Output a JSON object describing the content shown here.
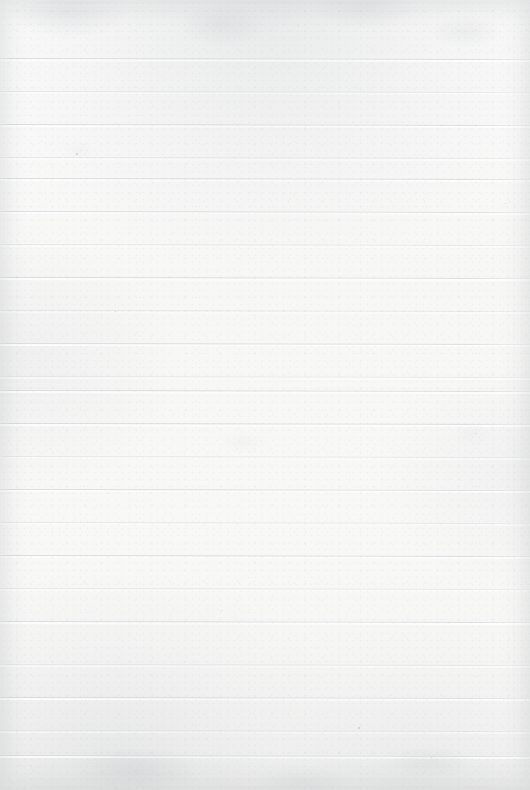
{
  "document": {
    "kind": "blank-ruled-notebook-page",
    "title": "",
    "heading": "",
    "body_text": "",
    "written_content": "",
    "page_number": "",
    "date_field": "",
    "width_px": 530,
    "height_px": 790
  },
  "paper": {
    "background_color": "#f8f8f7",
    "highlight_color": "#fafafa",
    "shadow_color": "#f5f5f4",
    "grain_color": "#a4a8ac",
    "mottle_color": "#babec2",
    "vignette_color": "#acb0b4"
  },
  "ruling": {
    "line_color": "#d6dadd",
    "line_color_light": "#dee1e3",
    "line_thickness_px": 1,
    "line_spacing_px": 32.8,
    "first_line_y_px": 58,
    "last_line_y_px": 755,
    "line_count": 22,
    "left_margin_rule": false,
    "vertical_rule_color": "",
    "tilt_degrees": 0.12,
    "lines": [
      {
        "index": 1,
        "y": 58,
        "weight": "strong"
      },
      {
        "index": 2,
        "y": 91,
        "weight": "faint"
      },
      {
        "index": 3,
        "y": 124,
        "weight": "strong"
      },
      {
        "index": 4,
        "y": 157,
        "weight": "faint"
      },
      {
        "index": 5,
        "y": 178,
        "weight": "strong"
      },
      {
        "index": 6,
        "y": 211,
        "weight": "strong"
      },
      {
        "index": 7,
        "y": 244,
        "weight": "faint"
      },
      {
        "index": 8,
        "y": 277,
        "weight": "strong"
      },
      {
        "index": 9,
        "y": 310,
        "weight": "faint"
      },
      {
        "index": 10,
        "y": 343,
        "weight": "strong"
      },
      {
        "index": 11,
        "y": 376,
        "weight": "faint"
      },
      {
        "index": 12,
        "y": 390,
        "weight": "strong"
      },
      {
        "index": 13,
        "y": 423,
        "weight": "strong"
      },
      {
        "index": 14,
        "y": 456,
        "weight": "faint"
      },
      {
        "index": 15,
        "y": 489,
        "weight": "strong"
      },
      {
        "index": 16,
        "y": 522,
        "weight": "faint"
      },
      {
        "index": 17,
        "y": 555,
        "weight": "strong"
      },
      {
        "index": 18,
        "y": 588,
        "weight": "faint"
      },
      {
        "index": 19,
        "y": 621,
        "weight": "strong"
      },
      {
        "index": 20,
        "y": 664,
        "weight": "faint"
      },
      {
        "index": 21,
        "y": 697,
        "weight": "strong"
      },
      {
        "index": 22,
        "y": 730,
        "weight": "faint"
      },
      {
        "index": 23,
        "y": 755,
        "weight": "strong"
      }
    ]
  },
  "specks": [
    {
      "x": 76,
      "y": 153,
      "size": 1.6
    },
    {
      "x": 475,
      "y": 433,
      "size": 1.4
    },
    {
      "x": 358,
      "y": 727,
      "size": 1.5
    },
    {
      "x": 431,
      "y": 757,
      "size": 1.3
    },
    {
      "x": 221,
      "y": 610,
      "size": 1.2
    },
    {
      "x": 115,
      "y": 311,
      "size": 1.1
    },
    {
      "x": 298,
      "y": 25,
      "size": 1.3
    },
    {
      "x": 505,
      "y": 203,
      "size": 1.1
    }
  ]
}
